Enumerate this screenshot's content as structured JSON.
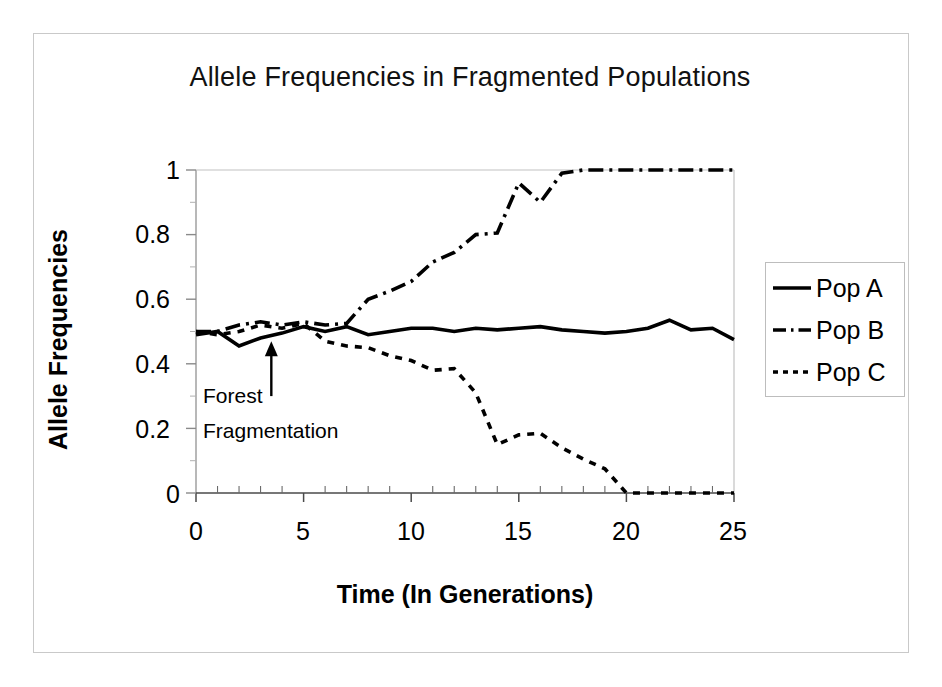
{
  "chart_data": {
    "type": "line",
    "title": "Allele Frequencies in Fragmented Populations",
    "xlabel": "Time (In Generations)",
    "ylabel": "Allele Frequencies",
    "xlim": [
      0,
      25
    ],
    "ylim": [
      0,
      1
    ],
    "xticks": [
      "0",
      "5",
      "10",
      "15",
      "20",
      "25"
    ],
    "xtick_values": [
      0,
      5,
      10,
      15,
      20,
      25
    ],
    "yticks": [
      "0",
      "0.2",
      "0.4",
      "0.6",
      "0.8",
      "1"
    ],
    "ytick_values": [
      0,
      0.2,
      0.4,
      0.6,
      0.8,
      1
    ],
    "minor_xticks": true,
    "minor_yticks": true,
    "grid": false,
    "legend_position": "right",
    "x": [
      0,
      1,
      2,
      3,
      4,
      5,
      6,
      7,
      8,
      9,
      10,
      11,
      12,
      13,
      14,
      15,
      16,
      17,
      18,
      19,
      20,
      21,
      22,
      23,
      24,
      25
    ],
    "series": [
      {
        "name": "Pop A",
        "linestyle": "solid",
        "color": "#000000",
        "values": [
          0.49,
          0.5,
          0.455,
          0.48,
          0.495,
          0.515,
          0.5,
          0.515,
          0.49,
          0.5,
          0.51,
          0.51,
          0.5,
          0.51,
          0.505,
          0.51,
          0.515,
          0.505,
          0.5,
          0.495,
          0.5,
          0.51,
          0.535,
          0.505,
          0.51,
          0.475
        ]
      },
      {
        "name": "Pop B",
        "linestyle": "dashdot",
        "color": "#000000",
        "values": [
          0.5,
          0.5,
          0.52,
          0.53,
          0.52,
          0.53,
          0.52,
          0.525,
          0.6,
          0.625,
          0.655,
          0.715,
          0.745,
          0.8,
          0.805,
          0.96,
          0.9,
          0.99,
          1.0,
          1.0,
          1.0,
          1.0,
          1.0,
          1.0,
          1.0,
          1.0
        ]
      },
      {
        "name": "Pop C",
        "linestyle": "dotted",
        "color": "#000000",
        "values": [
          0.5,
          0.49,
          0.5,
          0.52,
          0.51,
          0.525,
          0.47,
          0.455,
          0.45,
          0.425,
          0.41,
          0.38,
          0.385,
          0.31,
          0.15,
          0.18,
          0.185,
          0.14,
          0.105,
          0.075,
          0.0,
          0.0,
          0.0,
          0.0,
          0.0,
          0.0
        ]
      }
    ],
    "annotations": [
      {
        "text_line1": "Forest",
        "text_line2": "Fragmentation",
        "arrow_x": 3.5,
        "arrow_tip_y": 0.47,
        "arrow_tail_y": 0.3
      }
    ]
  },
  "legend": {
    "items": [
      {
        "label": "Pop A",
        "style": "solid"
      },
      {
        "label": "Pop B",
        "style": "dashdot"
      },
      {
        "label": "Pop C",
        "style": "dotted"
      }
    ]
  }
}
